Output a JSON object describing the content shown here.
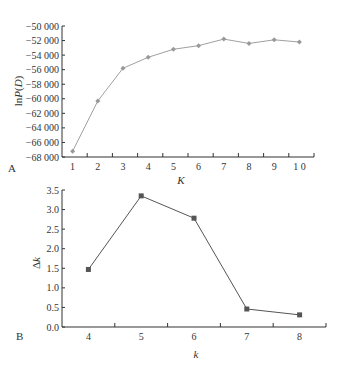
{
  "chart_data": [
    {
      "panel": "A",
      "type": "line",
      "title": "",
      "xlabel": "K",
      "ylabel": "lnP(D)",
      "ylabel_parts": {
        "pre": "ln",
        "italic": "P",
        "mid": "(",
        "italic2": "D",
        "post": ")"
      },
      "categories": [
        "1",
        "2",
        "3",
        "4",
        "5",
        "6",
        "7",
        "8",
        "9",
        "1 0"
      ],
      "x": [
        1,
        2,
        3,
        4,
        5,
        6,
        7,
        8,
        9,
        10
      ],
      "values": [
        -67200,
        -60300,
        -55800,
        -54300,
        -53200,
        -52700,
        -51800,
        -52400,
        -51900,
        -52200
      ],
      "ylim": [
        -68000,
        -50000
      ],
      "yticks": [
        -50000,
        -52000,
        -54000,
        -56000,
        -58000,
        -60000,
        -62000,
        -64000,
        -66000,
        -68000
      ],
      "ytick_labels": [
        "-50 000",
        "-52 000",
        "-54 000",
        "-56 000",
        "-58 000",
        "-60 000",
        "-62 000",
        "-64 000",
        "-66 000",
        "-68 000"
      ],
      "marker": "diamond",
      "line_color": "#a0a0a0",
      "grid": false,
      "legend": null
    },
    {
      "panel": "B",
      "type": "line",
      "title": "",
      "xlabel": "k",
      "ylabel": "Δk",
      "ylabel_parts": {
        "pre": "Δ",
        "italic": "k"
      },
      "categories": [
        "4",
        "5",
        "6",
        "7",
        "8"
      ],
      "x": [
        4,
        5,
        6,
        7,
        8
      ],
      "values": [
        1.47,
        3.35,
        2.78,
        0.46,
        0.31
      ],
      "ylim": [
        0.0,
        3.5
      ],
      "yticks": [
        0.0,
        0.5,
        1.0,
        1.5,
        2.0,
        2.5,
        3.0,
        3.5
      ],
      "ytick_labels": [
        "0.0",
        "0.5",
        "1.0",
        "1.5",
        "2.0",
        "2.5",
        "3.0",
        "3.5"
      ],
      "marker": "square",
      "line_color": "#555555",
      "grid": false,
      "legend": null
    }
  ]
}
